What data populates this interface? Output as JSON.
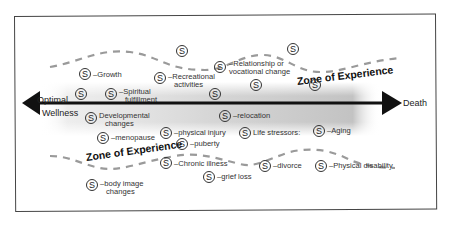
{
  "diagram": {
    "axis": {
      "start_label_line1": "Optimal",
      "start_label_line2": "Wellness",
      "end_label": "Death"
    },
    "zones": {
      "upper": "Zone of Experience",
      "lower": "Zone of Experience"
    },
    "stressor_symbol": "S",
    "upper_items": [
      {
        "id": "growth",
        "text": "–Growth"
      },
      {
        "id": "spiritual",
        "line1": "–Spiritual",
        "line2": "fulfillment"
      },
      {
        "id": "recreational",
        "line1": "–Recreational",
        "line2": "activities"
      },
      {
        "id": "relationship",
        "line1": "–Relationship or",
        "line2": "vocational change"
      }
    ],
    "lower_items": [
      {
        "id": "developmental",
        "line1": "Developmental",
        "line2": "changes"
      },
      {
        "id": "menopause",
        "text": "–menopause"
      },
      {
        "id": "physical-injury",
        "text": "–physical injury"
      },
      {
        "id": "puberty",
        "text": "–puberty"
      },
      {
        "id": "relocation",
        "text": "–relocation"
      },
      {
        "id": "life-stressors",
        "text": "Life stressors:"
      },
      {
        "id": "aging",
        "text": "–Aging"
      },
      {
        "id": "chronic-illness",
        "text": "–Chronic illness"
      },
      {
        "id": "grief-loss",
        "text": "–grief loss"
      },
      {
        "id": "divorce",
        "text": "–divorce"
      },
      {
        "id": "physical-disability",
        "text": "–Physical disability"
      },
      {
        "id": "body-image",
        "line1": "–body image",
        "line2": "changes"
      }
    ]
  }
}
